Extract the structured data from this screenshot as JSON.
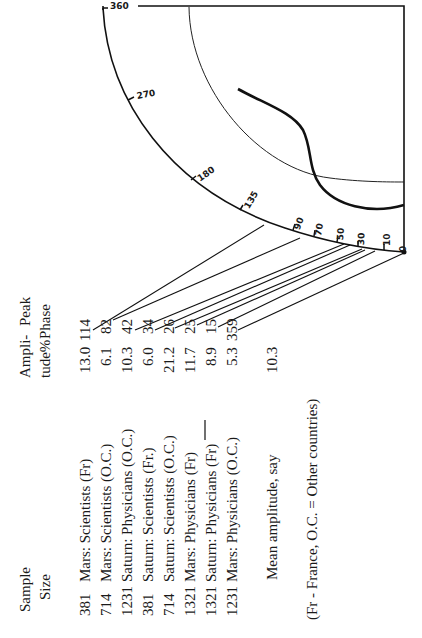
{
  "table": {
    "headers": {
      "sample_size": [
        "Sample",
        "Size"
      ],
      "amplitude": [
        "Ampli-",
        "tude%"
      ],
      "peak_phase": [
        "Peak",
        "Phase"
      ]
    },
    "rows": [
      {
        "size": "381",
        "group": "Mars: Scientists (Fr)",
        "amplitude": "13.0",
        "phase": "114"
      },
      {
        "size": "714",
        "group": "Mars: Scientists (O.C.)",
        "amplitude": "6.1",
        "phase": "82"
      },
      {
        "size": "1231",
        "group": "Saturn: Physicians (O.C.)",
        "amplitude": "10.3",
        "phase": "42"
      },
      {
        "size": "381",
        "group": "Saturn: Scientists (Fr.)",
        "amplitude": "6.0",
        "phase": "34"
      },
      {
        "size": "714",
        "group": "Saturn: Scientists (O.C.)",
        "amplitude": "21.2",
        "phase": "26"
      },
      {
        "size": "1321",
        "group": "Mars: Physicians (Fr)",
        "amplitude": "11.7",
        "phase": "25"
      },
      {
        "size": "1321",
        "group": "Saturn: Physicians (Fr)",
        "amplitude": "8.9",
        "phase": "15"
      },
      {
        "size": "1231",
        "group": "Mars: Physicians (O.C.)",
        "amplitude": "5.3",
        "phase": "359"
      }
    ],
    "mean_label": "Mean amplitude, say",
    "mean_value": "10.3",
    "footnote": "(Fr - France, O.C. = Other countries)"
  },
  "dial": {
    "labels": [
      "360",
      "270",
      "180",
      "135",
      "90",
      "70",
      "50",
      "30",
      "10",
      "0"
    ]
  }
}
